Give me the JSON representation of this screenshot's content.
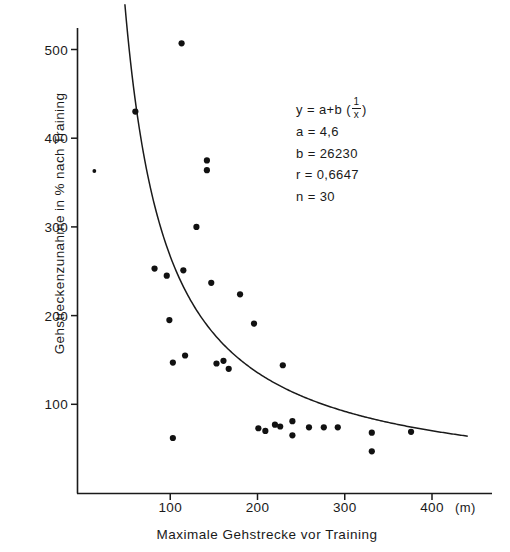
{
  "chart_data": {
    "type": "scatter",
    "title": "",
    "xlabel": "Maximale Gehstrecke vor Training",
    "ylabel": "Gehstreckenzunahme in % nach Training",
    "xunit": "(m)",
    "xlim": [
      0,
      430
    ],
    "ylim": [
      0,
      555
    ],
    "grid": false,
    "legend": null,
    "xticks": [
      100,
      200,
      300,
      400
    ],
    "yticks": [
      100,
      200,
      300,
      400,
      500
    ],
    "points": [
      {
        "x": 13,
        "y": 363
      },
      {
        "x": 60,
        "y": 430
      },
      {
        "x": 113,
        "y": 507
      },
      {
        "x": 142,
        "y": 375
      },
      {
        "x": 142,
        "y": 364
      },
      {
        "x": 130,
        "y": 300
      },
      {
        "x": 82,
        "y": 253
      },
      {
        "x": 96,
        "y": 245
      },
      {
        "x": 115,
        "y": 251
      },
      {
        "x": 147,
        "y": 237
      },
      {
        "x": 180,
        "y": 224
      },
      {
        "x": 99,
        "y": 195
      },
      {
        "x": 196,
        "y": 191
      },
      {
        "x": 117,
        "y": 155
      },
      {
        "x": 103,
        "y": 147
      },
      {
        "x": 153,
        "y": 146
      },
      {
        "x": 161,
        "y": 149
      },
      {
        "x": 167,
        "y": 140
      },
      {
        "x": 229,
        "y": 144
      },
      {
        "x": 103,
        "y": 62
      },
      {
        "x": 201,
        "y": 73
      },
      {
        "x": 209,
        "y": 70
      },
      {
        "x": 220,
        "y": 77
      },
      {
        "x": 226,
        "y": 75
      },
      {
        "x": 240,
        "y": 81
      },
      {
        "x": 240,
        "y": 65
      },
      {
        "x": 259,
        "y": 74
      },
      {
        "x": 276,
        "y": 74
      },
      {
        "x": 292,
        "y": 74
      },
      {
        "x": 331,
        "y": 68
      },
      {
        "x": 331,
        "y": 47
      },
      {
        "x": 376,
        "y": 69
      }
    ],
    "fit_curve": {
      "equation_label": "y = a+b (1/x)",
      "form": "y = a + b*(1/x)",
      "a": "4,6",
      "b": "26230",
      "r": "0,6647",
      "n": "30",
      "a_value": 4.6,
      "b_value": 26230,
      "x_start": 48,
      "x_end": 441
    }
  },
  "annotation": {
    "line1_lhs": "y = a+b (",
    "line1_num": "1",
    "line1_den": "x",
    "line1_rhs": ")",
    "line2": "a = 4,6",
    "line3": "b = 26230",
    "line4": "r = 0,6647",
    "line5": "n = 30"
  }
}
